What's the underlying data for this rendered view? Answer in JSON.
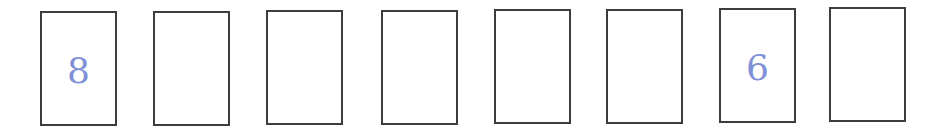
{
  "boxes": [
    {
      "index": 1,
      "value": "8",
      "left": 40,
      "top": 11
    },
    {
      "index": 2,
      "value": "",
      "left": 153,
      "top": 11
    },
    {
      "index": 3,
      "value": "",
      "left": 266,
      "top": 10
    },
    {
      "index": 4,
      "value": "",
      "left": 381,
      "top": 10
    },
    {
      "index": 5,
      "value": "",
      "left": 494,
      "top": 9
    },
    {
      "index": 6,
      "value": "",
      "left": 606,
      "top": 9
    },
    {
      "index": 7,
      "value": "6",
      "left": 719,
      "top": 8
    },
    {
      "index": 8,
      "value": "",
      "left": 829,
      "top": 7
    }
  ],
  "colors": {
    "digit": "#8090d6",
    "border": "#3d3d3d",
    "background": "#ffffff"
  }
}
